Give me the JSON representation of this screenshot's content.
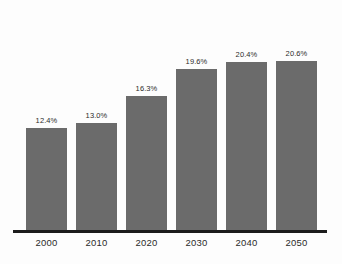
{
  "chart": {
    "background_color": "#fdfdfd",
    "bar_color": "#6b6b6b",
    "axis_color": "#1c1c1c",
    "label_color": "#2b2b2b"
  },
  "chart_data": {
    "type": "bar",
    "title": "",
    "subtitle": "",
    "xlabel": "",
    "ylabel": "",
    "categories": [
      "2000",
      "2010",
      "2020",
      "2030",
      "2040",
      "2050"
    ],
    "values": [
      12.4,
      13.0,
      16.3,
      19.6,
      20.4,
      20.6
    ],
    "value_labels": [
      "12.4%",
      "13.0%",
      "16.3%",
      "19.6%",
      "20.4%",
      "20.6%"
    ],
    "ylim": [
      0,
      28
    ],
    "grid": false,
    "legend": null,
    "annotations": [],
    "y_axis_visible": false,
    "x_axis_visible": true
  }
}
